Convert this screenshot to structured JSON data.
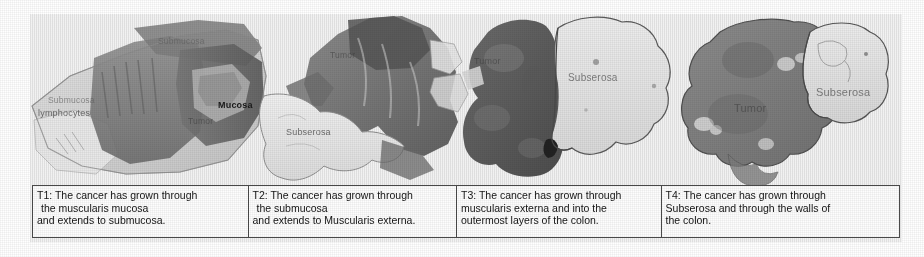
{
  "figure": {
    "panel_count": 4
  },
  "panels": [
    {
      "id": "T1",
      "name": "panel-t1",
      "annotations": [
        {
          "text": "Submucosa",
          "style": "faint"
        },
        {
          "text": "Submucosa",
          "style": "faint"
        },
        {
          "text": "lymphocytes",
          "style": "mid"
        },
        {
          "text": "Mucosa",
          "style": "dark"
        },
        {
          "text": "Tumor",
          "style": "ondark"
        }
      ]
    },
    {
      "id": "T2",
      "name": "panel-t2",
      "annotations": [
        {
          "text": "Tumor",
          "style": "ondark"
        },
        {
          "text": "Subserosa",
          "style": "mid"
        }
      ]
    },
    {
      "id": "T3",
      "name": "panel-t3",
      "annotations": [
        {
          "text": "Tumor",
          "style": "ondark"
        },
        {
          "text": "Subserosa",
          "style": "onlight"
        }
      ]
    },
    {
      "id": "T4",
      "name": "panel-t4",
      "annotations": [
        {
          "text": "Tumor",
          "style": "ondark"
        },
        {
          "text": "Subserosa",
          "style": "onlight"
        }
      ]
    }
  ],
  "captions": [
    {
      "id": "T1",
      "line1": "T1: The cancer has grown through",
      "line2": "the muscularis mucosa",
      "line3": "and extends to submucosa."
    },
    {
      "id": "T2",
      "line1": "T2: The cancer has grown through",
      "line2": "the submucosa",
      "line3": "and extends to Muscularis externa."
    },
    {
      "id": "T3",
      "line1": "T3: The cancer has grown through",
      "line2": "muscularis externa and into the",
      "line3": "outermost layers of the colon."
    },
    {
      "id": "T4",
      "line1": "T4: The cancer has grown through",
      "line2": "Subserosa and through the walls of",
      "line3": "the colon."
    }
  ],
  "colors": {
    "page_background": "#ffffff",
    "scan_background": "#fbfbfb",
    "table_border": "#4a4a4a",
    "caption_text": "#141414",
    "tissue_dark": "#6f6f6f",
    "tissue_mid": "#9a9a9a",
    "tissue_light": "#d8d8d8"
  }
}
